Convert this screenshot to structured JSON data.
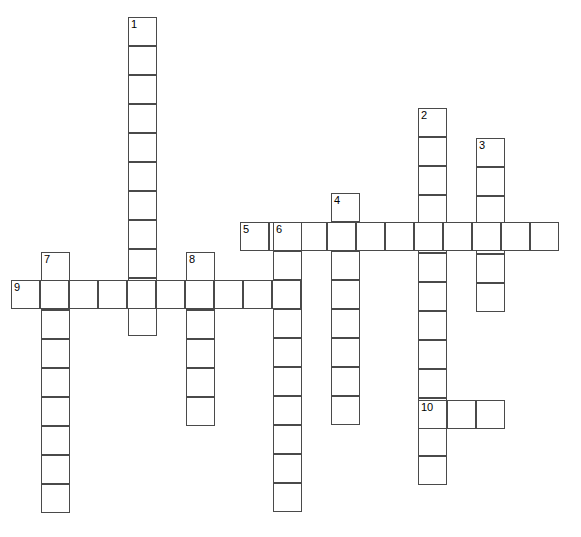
{
  "puzzle": {
    "title": "Crossword Puzzle Grid",
    "background_color": "#ffffff",
    "cell_border_color": "#4a4a4a",
    "number_color": "#000000",
    "cell_size": 29,
    "width": 581,
    "height": 537,
    "entries": [
      {
        "number": "1",
        "direction": "down",
        "x": 128,
        "y": 17,
        "length": 11
      },
      {
        "number": "2",
        "direction": "down",
        "x": 418,
        "y": 108,
        "length": 13
      },
      {
        "number": "3",
        "direction": "down",
        "x": 476,
        "y": 138,
        "length": 6
      },
      {
        "number": "4",
        "direction": "down",
        "x": 331,
        "y": 193,
        "length": 8
      },
      {
        "number": "5",
        "direction": "across",
        "x": 240,
        "y": 222,
        "length": 11
      },
      {
        "number": "6",
        "direction": "down",
        "x": 273,
        "y": 222,
        "length": 10
      },
      {
        "number": "7",
        "direction": "down",
        "x": 41,
        "y": 252,
        "length": 9
      },
      {
        "number": "8",
        "direction": "down",
        "x": 186,
        "y": 252,
        "length": 6
      },
      {
        "number": "9",
        "direction": "across",
        "x": 11,
        "y": 280,
        "length": 10
      },
      {
        "number": "10",
        "direction": "across",
        "x": 418,
        "y": 400,
        "length": 3
      }
    ],
    "numbered_labels": [
      "1",
      "2",
      "3",
      "4",
      "5",
      "6",
      "7",
      "8",
      "9",
      "10"
    ]
  }
}
